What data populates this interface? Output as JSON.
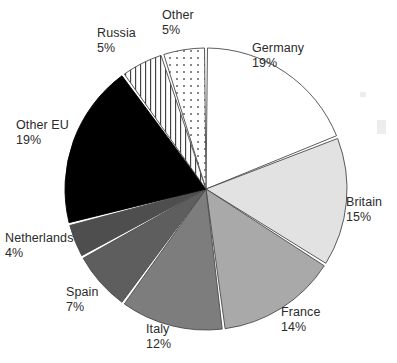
{
  "chart_data": {
    "type": "pie",
    "title": "",
    "categories": [
      "Germany",
      "Britain",
      "France",
      "Italy",
      "Spain",
      "Netherlands",
      "Other EU",
      "Russia",
      "Other"
    ],
    "values": [
      19,
      15,
      14,
      12,
      7,
      4,
      19,
      5,
      5
    ],
    "value_unit": "%",
    "start_angle_deg": 0,
    "direction": "clockwise",
    "legend": "none",
    "labels_position": "outside",
    "slices": [
      {
        "label": "Germany",
        "value": 19,
        "value_text": "19%",
        "fill": "#ffffff",
        "pattern": "solid",
        "stroke": "#4a4a4a"
      },
      {
        "label": "Britain",
        "value": 15,
        "value_text": "15%",
        "fill": "#e2e2e2",
        "pattern": "solid",
        "stroke": "#4a4a4a"
      },
      {
        "label": "France",
        "value": 14,
        "value_text": "14%",
        "fill": "#a9a9a9",
        "pattern": "solid",
        "stroke": "#4a4a4a"
      },
      {
        "label": "Italy",
        "value": 12,
        "value_text": "12%",
        "fill": "#7d7d7d",
        "pattern": "solid",
        "stroke": "#4a4a4a"
      },
      {
        "label": "Spain",
        "value": 7,
        "value_text": "7%",
        "fill": "#5e5e5e",
        "pattern": "solid",
        "stroke": "#4a4a4a"
      },
      {
        "label": "Netherlands",
        "value": 4,
        "value_text": "4%",
        "fill": "#4e4e4e",
        "pattern": "solid",
        "stroke": "#4a4a4a"
      },
      {
        "label": "Other EU",
        "value": 19,
        "value_text": "19%",
        "fill": "#000000",
        "pattern": "solid",
        "stroke": "#000000"
      },
      {
        "label": "Russia",
        "value": 5,
        "value_text": "5%",
        "fill": "#ffffff",
        "pattern": "vertical-lines",
        "stroke": "#4a4a4a"
      },
      {
        "label": "Other",
        "value": 5,
        "value_text": "5%",
        "fill": "#ffffff",
        "pattern": "dots",
        "stroke": "#4a4a4a"
      }
    ]
  },
  "geometry": {
    "center_x": 206,
    "center_y": 189,
    "radius": 141,
    "gap_deg": 1.2
  },
  "colors": {
    "background": "#ffffff",
    "label_text": "#2b2b2b",
    "outline": "#4a4a4a",
    "separator": "#ffffff"
  }
}
